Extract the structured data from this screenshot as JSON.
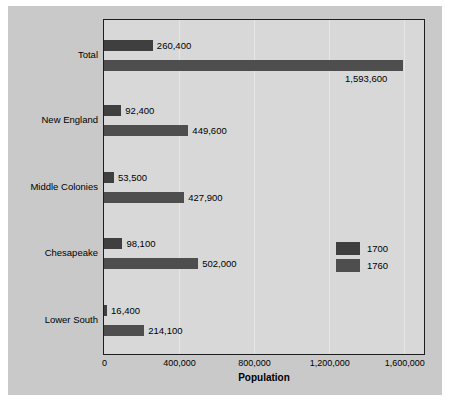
{
  "chart_data": {
    "type": "bar",
    "orientation": "horizontal",
    "title": "",
    "xlabel": "Population",
    "ylabel": "",
    "xlim": [
      0,
      1700000
    ],
    "xticks": [
      0,
      400000,
      800000,
      1200000,
      1600000
    ],
    "xtick_labels": [
      "0",
      "400,000",
      "800,000",
      "1,200,000",
      "1,600,000"
    ],
    "categories": [
      "Total",
      "New England",
      "Middle Colonies",
      "Chesapeake",
      "Lower South"
    ],
    "grid": true,
    "legend_position": "center-right",
    "series": [
      {
        "name": "1700",
        "color": "#3f3f3f",
        "values": [
          260400,
          92400,
          53500,
          98100,
          16400
        ],
        "labels": [
          "260,400",
          "92,400",
          "53,500",
          "98,100",
          "16,400"
        ]
      },
      {
        "name": "1760",
        "color": "#4e4e4e",
        "values": [
          1593600,
          449600,
          427900,
          502000,
          214100
        ],
        "labels": [
          "1,593,600",
          "449,600",
          "427,900",
          "502,000",
          "214,100"
        ]
      }
    ]
  },
  "legend": {
    "items": [
      {
        "label": "1700",
        "color": "#3f3f3f"
      },
      {
        "label": "1760",
        "color": "#4e4e4e"
      }
    ]
  },
  "axis": {
    "x_title": "Population",
    "ticks": [
      "0",
      "400,000",
      "800,000",
      "1,200,000",
      "1,600,000"
    ]
  },
  "categories": [
    {
      "label": "Total"
    },
    {
      "label": "New England"
    },
    {
      "label": "Middle Colonies"
    },
    {
      "label": "Chesapeake"
    },
    {
      "label": "Lower South"
    }
  ],
  "colors": {
    "canvas": "#c9c9c9",
    "plot_background": "#d8d8d8",
    "plot_border": "#1d1d1d",
    "gridline": "#e6e6e6",
    "series_1700": "#3f3f3f",
    "series_1760": "#4e4e4e",
    "text": "#000000"
  }
}
